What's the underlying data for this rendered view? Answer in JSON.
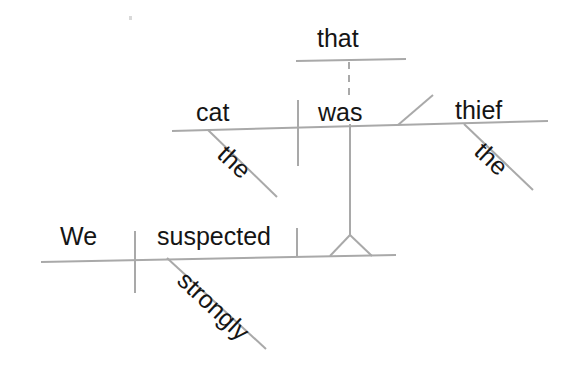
{
  "diagram": {
    "kind": "reed-kellogg-sentence-diagram",
    "sentence": "We strongly suspected that the cat was the thief.",
    "line_color": "#a9a9a9",
    "text_color": "#151515",
    "background_color": "#ffffff",
    "labels": {
      "we": "We",
      "suspected": "suspected",
      "strongly": "strongly",
      "that": "that",
      "cat": "cat",
      "was": "was",
      "thief": "thief",
      "the_subject": "the",
      "the_predicate": "the"
    },
    "parts": [
      {
        "word": "We",
        "role": "subject",
        "clause": "main"
      },
      {
        "word": "suspected",
        "role": "verb",
        "clause": "main"
      },
      {
        "word": "strongly",
        "role": "adverb",
        "modifies": "suspected"
      },
      {
        "word": "that",
        "role": "subordinating-conjunction",
        "clause": "noun-clause"
      },
      {
        "word": "the",
        "role": "article",
        "modifies": "cat"
      },
      {
        "word": "cat",
        "role": "subject",
        "clause": "noun-clause"
      },
      {
        "word": "was",
        "role": "linking-verb",
        "clause": "noun-clause"
      },
      {
        "word": "the",
        "role": "article",
        "modifies": "thief"
      },
      {
        "word": "thief",
        "role": "predicate-nominative",
        "clause": "noun-clause"
      }
    ],
    "structure": {
      "main_baseline": "We | suspected",
      "clause_baseline": "cat | was \\ thief",
      "connector": "dashed vertical line from 'that' down to clause baseline",
      "pedestal": "tripod stand carrying the noun clause onto the direct-object slot"
    }
  }
}
